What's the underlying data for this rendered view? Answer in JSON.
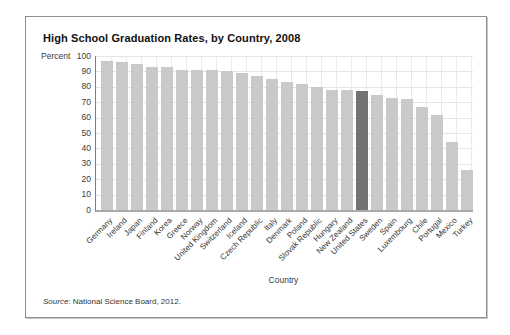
{
  "figure": {
    "title": "High School Graduation Rates, by Country, 2008",
    "source_label": "Source",
    "source_text": ": National Science Board, 2012."
  },
  "chart_data": {
    "type": "bar",
    "title": "High School Graduation Rates, by Country, 2008",
    "ylabel": "Percent",
    "xlabel": "Country",
    "ylim": [
      0,
      100
    ],
    "ytick_step": 10,
    "grid": true,
    "legend": "none",
    "categories": [
      "Germany",
      "Ireland",
      "Japan",
      "Finland",
      "Korea",
      "Greece",
      "Norway",
      "United Kingdom",
      "Switzerland",
      "Iceland",
      "Czech Republic",
      "Italy",
      "Denmark",
      "Poland",
      "Slovak Republic",
      "Hungary",
      "New Zealand",
      "United States",
      "Sweden",
      "Spain",
      "Luxembourg",
      "Chile",
      "Portugal",
      "Mexico",
      "Turkey"
    ],
    "values": [
      97,
      96,
      95,
      93,
      93,
      91,
      91,
      91,
      90,
      89,
      87,
      85,
      83,
      82,
      80,
      78,
      78,
      77,
      75,
      73,
      72,
      67,
      62,
      44,
      26
    ],
    "highlight_category": "United States",
    "bar_color": "#c9c9c9",
    "highlight_color": "#737373"
  }
}
